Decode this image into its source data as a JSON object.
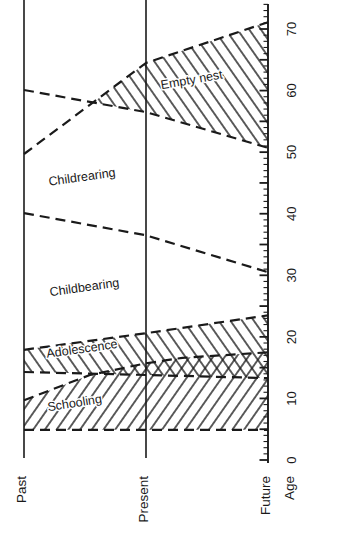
{
  "chart_data": {
    "type": "area",
    "title": "",
    "orientation": "rotated-90-landscape",
    "description_note": "Family life-cycle stage bands by age, shown for Past / Present / Future; age axis vertical on right, all axis text rotated 90 degrees",
    "time_axis": {
      "categories": [
        {
          "label": "Past",
          "t": 0
        },
        {
          "label": "Present",
          "t": 0.5
        },
        {
          "label": "Future",
          "t": 1
        }
      ]
    },
    "age_axis": {
      "label": "Age",
      "min": 0,
      "max": 74,
      "minor_step": 1,
      "major_step": 5,
      "label_step": 10,
      "tick_labels": [
        "0",
        "10",
        "20",
        "30",
        "40",
        "50",
        "60",
        "70"
      ]
    },
    "boundaries": [
      {
        "name": "lifespan-upper",
        "points": [
          {
            "t": 0,
            "age": 49.7
          },
          {
            "t": 0.5,
            "age": 64.5
          },
          {
            "t": 1,
            "age": 71.1
          }
        ]
      },
      {
        "name": "empty-nest-lower",
        "points": [
          {
            "t": 0,
            "age": 60.1
          },
          {
            "t": 0.5,
            "age": 56.5
          },
          {
            "t": 1,
            "age": 50.7
          }
        ]
      },
      {
        "name": "childbearing-upper",
        "points": [
          {
            "t": 0,
            "age": 40.1
          },
          {
            "t": 0.5,
            "age": 36.5
          },
          {
            "t": 1,
            "age": 30.5
          }
        ]
      },
      {
        "name": "adolescence-upper",
        "points": [
          {
            "t": 0,
            "age": 17.9
          },
          {
            "t": 0.5,
            "age": 20.6
          },
          {
            "t": 1,
            "age": 23.5
          }
        ]
      },
      {
        "name": "adolescence-lower",
        "points": [
          {
            "t": 0,
            "age": 14.3
          },
          {
            "t": 0.5,
            "age": 13.8
          },
          {
            "t": 1,
            "age": 13.3
          }
        ]
      },
      {
        "name": "schooling-upper",
        "points": [
          {
            "t": 0,
            "age": 9.7
          },
          {
            "t": 0.27,
            "age": 13.8
          },
          {
            "t": 0.5,
            "age": 15.7
          },
          {
            "t": 0.65,
            "age": 16.6
          },
          {
            "t": 1,
            "age": 17.5
          }
        ]
      },
      {
        "name": "schooling-lower",
        "points": [
          {
            "t": 0,
            "age": 4.9
          },
          {
            "t": 1,
            "age": 4.9
          }
        ]
      }
    ],
    "regions": [
      {
        "name": "empty-nest",
        "label": "Empty nest",
        "hatch": "back",
        "upper": "lifespan-upper",
        "lower": "empty-nest-lower",
        "t_start": 0.285,
        "label_anchor": {
          "t": 0.69,
          "age": 61.1
        },
        "label_rotation": -10
      },
      {
        "name": "childrearing",
        "label": "Childrearing",
        "hatch": "none",
        "upper": "empty-nest-lower",
        "lower": "childbearing-upper",
        "t_start": 0,
        "label_anchor": {
          "t": 0.24,
          "age": 45.3
        },
        "label_rotation": -8
      },
      {
        "name": "childbearing",
        "label": "Childbearing",
        "hatch": "none",
        "upper": "childbearing-upper",
        "lower": "adolescence-upper",
        "t_start": 0,
        "label_anchor": {
          "t": 0.25,
          "age": 27.4
        },
        "label_rotation": -8
      },
      {
        "name": "adolescence",
        "label": "Adolescence",
        "hatch": "back",
        "upper": "adolescence-upper",
        "lower": "adolescence-lower",
        "t_start": 0,
        "label_anchor": {
          "t": 0.24,
          "age": 17.4
        },
        "label_rotation": -8
      },
      {
        "name": "schooling",
        "label": "Schooling",
        "hatch": "forward",
        "upper": "schooling-upper",
        "lower": "schooling-lower",
        "t_start": 0,
        "label_anchor": {
          "t": 0.21,
          "age": 8.6
        },
        "label_rotation": -9
      }
    ],
    "colors": {
      "ink": "#1a1a1a",
      "background": "#ffffff"
    }
  }
}
